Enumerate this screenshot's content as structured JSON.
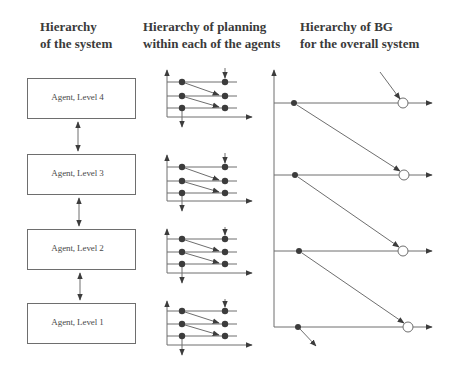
{
  "headings": {
    "system": {
      "line1": "Hierarchy",
      "line2": "of the system"
    },
    "planning": {
      "line1": "Hierarchy of planning",
      "line2": "within each of the agents"
    },
    "bg": {
      "line1": "Hierarchy of BG",
      "line2": "for the overall system"
    }
  },
  "agents": [
    {
      "label": "Agent, Level 4",
      "top": 78
    },
    {
      "label": "Agent, Level 3",
      "top": 154
    },
    {
      "label": "Agent, Level 2",
      "top": 229
    },
    {
      "label": "Agent, Level 1",
      "top": 303
    }
  ],
  "connectors": [
    {
      "x": 78,
      "y1": 122,
      "y2": 151
    },
    {
      "x": 79,
      "y1": 198,
      "y2": 226
    },
    {
      "x": 80,
      "y1": 273,
      "y2": 300
    }
  ],
  "planning_diagrams": [
    {
      "axis_top": 70,
      "lines": [
        82,
        96,
        108
      ],
      "axis_bottom": 117
    },
    {
      "axis_top": 155,
      "lines": [
        167,
        181,
        193
      ],
      "axis_bottom": 201
    },
    {
      "axis_top": 229,
      "lines": [
        239,
        252,
        264
      ],
      "axis_bottom": 273
    },
    {
      "axis_top": 301,
      "lines": [
        311,
        324,
        336
      ],
      "axis_bottom": 345
    }
  ],
  "bg_levels": [
    {
      "y": 103,
      "dot_x": 294,
      "circle_x": 403
    },
    {
      "y": 175,
      "dot_x": 295,
      "circle_x": 404
    },
    {
      "y": 251,
      "dot_x": 299,
      "circle_x": 403
    },
    {
      "y": 327,
      "dot_x": 298,
      "circle_x": 408
    }
  ],
  "colors": {
    "line": "#6e6e6e",
    "dot": "#3c3c3c",
    "text": "#3a3a3a",
    "background": "#ffffff"
  }
}
